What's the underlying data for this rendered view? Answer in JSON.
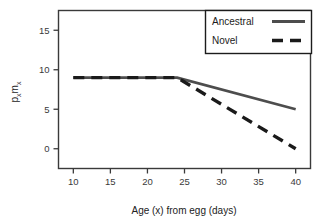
{
  "chart_data": {
    "type": "line",
    "title": "",
    "xlabel": "Age (x) from egg (days)",
    "ylabel": "p_x m_x",
    "ylabel_parts": {
      "p": "p",
      "x1": "x",
      "m": "m",
      "x2": "x"
    },
    "xlim": [
      8,
      42
    ],
    "ylim": [
      -2.5,
      17.5
    ],
    "xticks": [
      10,
      15,
      20,
      25,
      30,
      35,
      40
    ],
    "xticklabels": [
      "10",
      "15",
      "20",
      "25",
      "30",
      "35",
      "40"
    ],
    "yticks": [
      0,
      5,
      10,
      15
    ],
    "yticklabels": [
      "0",
      "5",
      "10",
      "15"
    ],
    "grid": false,
    "frame": true,
    "legend_position": "top-right",
    "series": [
      {
        "name": "Ancestral",
        "style": "solid",
        "color": "#4d4d4d",
        "x": [
          10,
          24,
          40
        ],
        "y": [
          9,
          9,
          5
        ]
      },
      {
        "name": "Novel",
        "style": "dashed",
        "color": "#1a1a1a",
        "x": [
          10,
          24,
          40
        ],
        "y": [
          9,
          9,
          0
        ]
      }
    ]
  },
  "legend": {
    "items": [
      {
        "label": "Ancestral",
        "style": "solid"
      },
      {
        "label": "Novel",
        "style": "dashed"
      }
    ]
  },
  "colors": {
    "ancestral": "#4d4d4d",
    "novel": "#1a1a1a",
    "axis": "#3a3a3a",
    "background": "#ffffff"
  }
}
